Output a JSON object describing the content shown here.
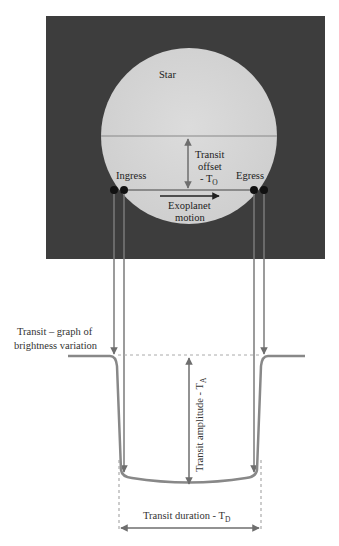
{
  "diagram": {
    "star_label": "Star",
    "transit_offset_line1": "Transit",
    "transit_offset_line2": "offset",
    "transit_offset_line3": "- T",
    "transit_offset_sub": "O",
    "ingress_label": "Ingress",
    "egress_label": "Egress",
    "motion_line1": "Exoplanet",
    "motion_line2": "motion",
    "graph_label_line1": "Transit – graph of",
    "graph_label_line2": "brightness variation",
    "amplitude_label": "Transit amplitude - T",
    "amplitude_sub": "A",
    "duration_label": "Transit duration - T",
    "duration_sub": "D"
  },
  "colors": {
    "background_panel": "#3d3d3d",
    "star_fill": "#d6d6d6",
    "lines": "#7a7a7a",
    "planet": "#111111",
    "text": "#222222"
  }
}
